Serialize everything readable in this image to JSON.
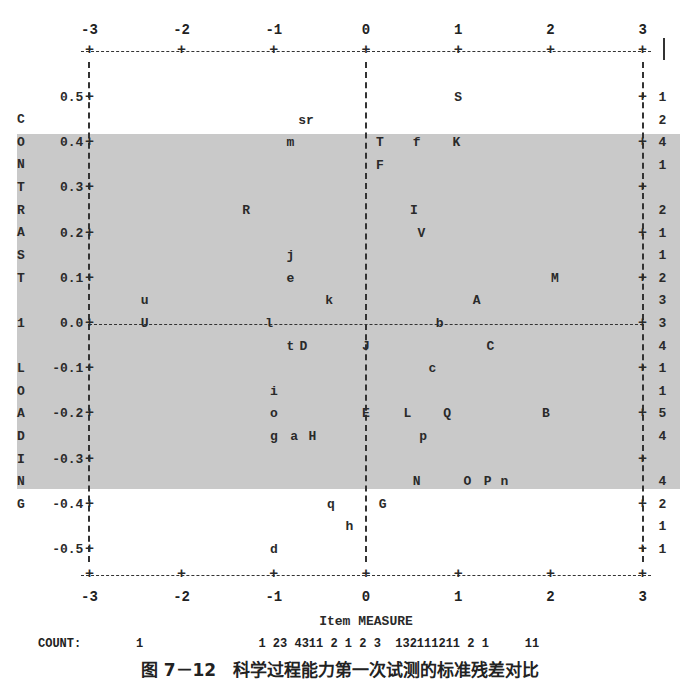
{
  "chart_data": {
    "type": "scatter",
    "title": "",
    "caption": "图 7－12　科学过程能力第一次试测的标准残差对比",
    "xlabel": "Item MEASURE",
    "ylabel": "CONTRAST 1 LOADING",
    "xlim": [
      -3,
      3
    ],
    "ylim": [
      -0.5,
      0.5
    ],
    "x_ticks": [
      "-3",
      "-2",
      "-1",
      "0",
      "1",
      "2",
      "3"
    ],
    "y_ticks": [
      "0.5",
      "0.4",
      "0.3",
      "0.2",
      "0.1",
      "0.0",
      "-0.1",
      "-0.2",
      "-0.3",
      "-0.4",
      "-0.5"
    ],
    "ylabel_letters": [
      "C",
      "O",
      "N",
      "T",
      "R",
      "A",
      "S",
      "T",
      "",
      "1",
      "",
      "L",
      "O",
      "A",
      "D",
      "I",
      "N",
      "G"
    ],
    "shaded_band": [
      -0.4,
      0.4
    ],
    "points": [
      {
        "label": "S",
        "x": 1.0,
        "y": 0.5
      },
      {
        "label": "sr",
        "x": -0.65,
        "y": 0.45
      },
      {
        "label": "m",
        "x": -0.82,
        "y": 0.4
      },
      {
        "label": "T",
        "x": 0.15,
        "y": 0.4
      },
      {
        "label": "f",
        "x": 0.55,
        "y": 0.4
      },
      {
        "label": "K",
        "x": 0.98,
        "y": 0.4
      },
      {
        "label": "F",
        "x": 0.15,
        "y": 0.35
      },
      {
        "label": "R",
        "x": -1.3,
        "y": 0.25
      },
      {
        "label": "I",
        "x": 0.52,
        "y": 0.25
      },
      {
        "label": "V",
        "x": 0.6,
        "y": 0.2
      },
      {
        "label": "j",
        "x": -0.82,
        "y": 0.15
      },
      {
        "label": "e",
        "x": -0.82,
        "y": 0.1
      },
      {
        "label": "M",
        "x": 2.05,
        "y": 0.1
      },
      {
        "label": "u",
        "x": -2.4,
        "y": 0.05
      },
      {
        "label": "k",
        "x": -0.4,
        "y": 0.05
      },
      {
        "label": "A",
        "x": 1.2,
        "y": 0.05
      },
      {
        "label": "U",
        "x": -2.4,
        "y": 0.0
      },
      {
        "label": "l",
        "x": -1.05,
        "y": 0.0
      },
      {
        "label": "b",
        "x": 0.8,
        "y": 0.0
      },
      {
        "label": "t",
        "x": -0.82,
        "y": -0.05
      },
      {
        "label": "D",
        "x": -0.68,
        "y": -0.05
      },
      {
        "label": "J",
        "x": 0.0,
        "y": -0.05
      },
      {
        "label": "C",
        "x": 1.35,
        "y": -0.05
      },
      {
        "label": "c",
        "x": 0.72,
        "y": -0.1
      },
      {
        "label": "i",
        "x": -1.0,
        "y": -0.15
      },
      {
        "label": "o",
        "x": -1.0,
        "y": -0.2
      },
      {
        "label": "E",
        "x": 0.0,
        "y": -0.2
      },
      {
        "label": "L",
        "x": 0.45,
        "y": -0.2
      },
      {
        "label": "Q",
        "x": 0.88,
        "y": -0.2
      },
      {
        "label": "B",
        "x": 1.95,
        "y": -0.2
      },
      {
        "label": "g",
        "x": -1.0,
        "y": -0.25
      },
      {
        "label": "a",
        "x": -0.78,
        "y": -0.25
      },
      {
        "label": "H",
        "x": -0.58,
        "y": -0.25
      },
      {
        "label": "p",
        "x": 0.62,
        "y": -0.25
      },
      {
        "label": "N",
        "x": 0.55,
        "y": -0.35
      },
      {
        "label": "O",
        "x": 1.1,
        "y": -0.35
      },
      {
        "label": "P",
        "x": 1.32,
        "y": -0.35
      },
      {
        "label": "n",
        "x": 1.5,
        "y": -0.35
      },
      {
        "label": "q",
        "x": -0.38,
        "y": -0.4
      },
      {
        "label": "G",
        "x": 0.18,
        "y": -0.4
      },
      {
        "label": "h",
        "x": -0.18,
        "y": -0.45
      },
      {
        "label": "d",
        "x": -1.0,
        "y": -0.5
      }
    ],
    "right_counts": [
      {
        "y": 0.5,
        "count": "1"
      },
      {
        "y": 0.45,
        "count": "2"
      },
      {
        "y": 0.4,
        "count": "4"
      },
      {
        "y": 0.35,
        "count": "1"
      },
      {
        "y": 0.3,
        "count": ""
      },
      {
        "y": 0.25,
        "count": "2"
      },
      {
        "y": 0.2,
        "count": "1"
      },
      {
        "y": 0.15,
        "count": "1"
      },
      {
        "y": 0.1,
        "count": "2"
      },
      {
        "y": 0.05,
        "count": "3"
      },
      {
        "y": 0.0,
        "count": "3"
      },
      {
        "y": -0.05,
        "count": "4"
      },
      {
        "y": -0.1,
        "count": "1"
      },
      {
        "y": -0.15,
        "count": "1"
      },
      {
        "y": -0.2,
        "count": "5"
      },
      {
        "y": -0.25,
        "count": "4"
      },
      {
        "y": -0.3,
        "count": ""
      },
      {
        "y": -0.35,
        "count": "4"
      },
      {
        "y": -0.4,
        "count": "2"
      },
      {
        "y": -0.45,
        "count": "1"
      },
      {
        "y": -0.5,
        "count": "1"
      }
    ],
    "count_label": "COUNT:",
    "count_row": "1                1 23 4311 2 1 2 3  132111211 2 1     11",
    "grid": false
  }
}
